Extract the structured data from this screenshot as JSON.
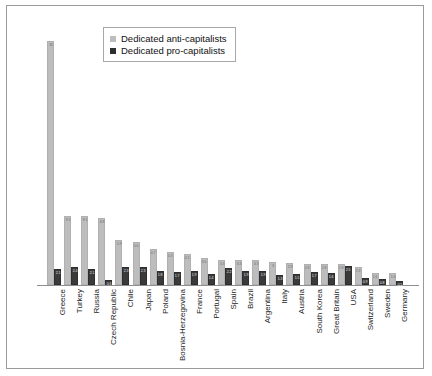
{
  "chart_data": {
    "type": "bar",
    "title": "",
    "subtitle": "",
    "xlabel": "",
    "ylabel": "",
    "ylim": [
      0,
      34
    ],
    "grid": false,
    "legend_position": "top-center",
    "categories": [
      "Greece",
      "Turkey",
      "Russia",
      "Czech Republic",
      "Chile",
      "Japan",
      "Poland",
      "Bosnia-Herzegovina",
      "France",
      "Portugal",
      "Spain",
      "Brazil",
      "Argentina",
      "Italy",
      "Austria",
      "South Korea",
      "Great Britain",
      "USA",
      "Switzerland",
      "Sweden",
      "Germany"
    ],
    "series": [
      {
        "name": "Dedicated anti-capitalists",
        "color": "#bdbdbd",
        "values": [
          32,
          9.1,
          9.1,
          8.8,
          5.9,
          5.6,
          4.7,
          4.3,
          4.1,
          3.6,
          3.3,
          3.3,
          3.3,
          3.0,
          2.9,
          2.8,
          2.8,
          2.8,
          2.3,
          1.6,
          1.6
        ]
      },
      {
        "name": "Dedicated pro-capitalists",
        "color": "#2e2e2e",
        "values": [
          2.1,
          2.4,
          2.1,
          0.6,
          2.3,
          2.3,
          1.8,
          1.7,
          1.9,
          1.4,
          2.2,
          1.9,
          1.9,
          1.3,
          1.5,
          1.7,
          1.6,
          2.5,
          0.9,
          0.8,
          0.5
        ]
      }
    ]
  },
  "legend": {
    "entries": [
      {
        "label": "Dedicated anti-capitalists",
        "icon": "square-swatch-icon"
      },
      {
        "label": "Dedicated pro-capitalists",
        "icon": "square-swatch-icon"
      }
    ]
  }
}
